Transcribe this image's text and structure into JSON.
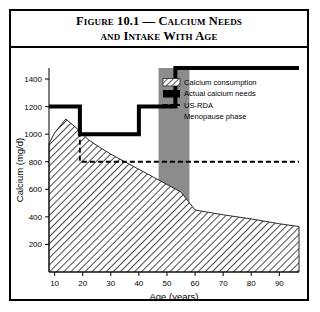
{
  "figure": {
    "title_line1": "Figure 10.1 — Calcium Needs",
    "title_line2": "and Intake With Age"
  },
  "chart_data": {
    "type": "area",
    "title": "Figure 10.1 — Calcium Needs and Intake With Age",
    "xlabel": "Age (years)",
    "ylabel": "Calcium (mg/d)",
    "xlim": [
      8,
      97
    ],
    "ylim": [
      0,
      1480
    ],
    "xticks": [
      10,
      20,
      30,
      40,
      50,
      60,
      70,
      80,
      90
    ],
    "yticks": [
      200,
      400,
      600,
      800,
      1000,
      1200,
      1400
    ],
    "grid": false,
    "legend_position": "top-right",
    "series": [
      {
        "name": "Calcium consumption",
        "type": "area",
        "style": "hatched",
        "x": [
          8,
          10,
          14,
          18,
          22,
          26,
          30,
          35,
          40,
          45,
          50,
          55,
          60,
          70,
          80,
          90,
          97
        ],
        "values": [
          930,
          1010,
          1110,
          1040,
          960,
          905,
          855,
          800,
          745,
          690,
          635,
          580,
          450,
          415,
          385,
          350,
          330
        ]
      },
      {
        "name": "Actual calcium needs",
        "type": "step",
        "style": "thick-black-line",
        "x": [
          8,
          19,
          19,
          40,
          40,
          53,
          53,
          97
        ],
        "values": [
          1200,
          1200,
          1000,
          1000,
          1200,
          1200,
          1480,
          1480
        ]
      },
      {
        "name": "US-RDA",
        "type": "step",
        "style": "dashed-line",
        "x": [
          8,
          19,
          19,
          97
        ],
        "values": [
          1200,
          1200,
          800,
          800
        ]
      },
      {
        "name": "Menopause phase",
        "type": "band",
        "style": "gray-fill",
        "x_start": 47,
        "x_end": 58,
        "values": [
          0,
          1480
        ]
      }
    ]
  },
  "legend": {
    "items": [
      {
        "label": "Calcium consumption",
        "swatch": "hatched-swatch"
      },
      {
        "label": "Actual calcium needs",
        "swatch": "black-bar-swatch"
      },
      {
        "label": "US-RDA",
        "swatch": "dashed-line-swatch"
      },
      {
        "label": "Menopause phase",
        "swatch": "gray-fill-swatch"
      }
    ]
  },
  "colors": {
    "axis": "#000000",
    "needs_line": "#000000",
    "rda_line": "#000000",
    "menopause_band": "#8c8c8c",
    "hatch": "#333333",
    "background": "#ffffff"
  }
}
